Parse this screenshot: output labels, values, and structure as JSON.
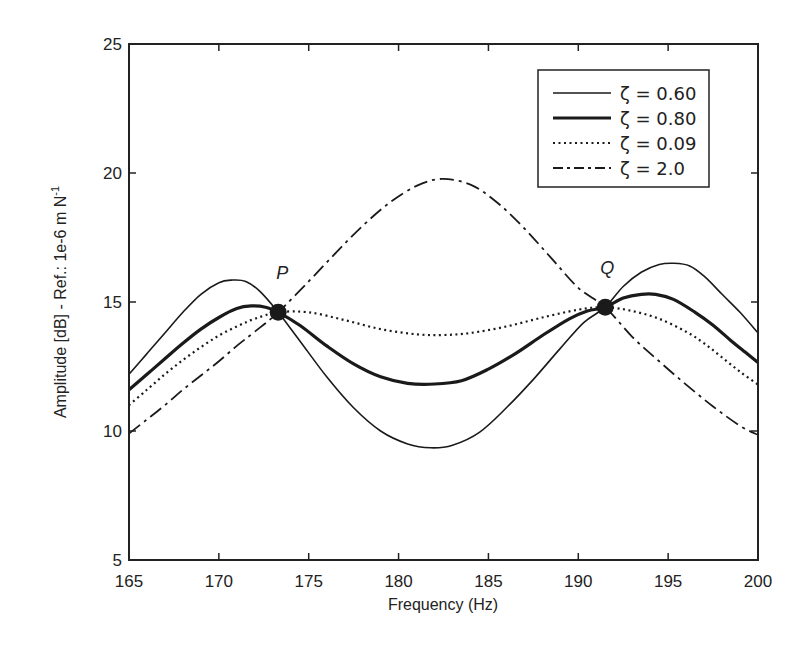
{
  "chart_data": {
    "type": "line",
    "title": "",
    "xlabel": "Frequency (Hz)",
    "ylabel": "Amplitude [dB] - Ref.: 1e-6 m N",
    "ylabel_superscript": "-1",
    "xlim": [
      165,
      200
    ],
    "ylim": [
      5,
      25
    ],
    "xticks": [
      165,
      170,
      175,
      180,
      185,
      190,
      195,
      200
    ],
    "yticks": [
      5,
      10,
      15,
      20,
      25
    ],
    "grid": false,
    "legend_position": "upper right",
    "series": [
      {
        "name": "ζ = 0.60",
        "style": "solid-thin",
        "x": [
          165,
          166,
          167,
          168,
          169,
          170,
          170.7,
          171.5,
          172.3,
          173.3,
          174.5,
          176,
          177.5,
          179,
          180.5,
          181.8,
          183,
          184.5,
          186,
          187.5,
          189,
          190.3,
          191.5,
          192.5,
          193.5,
          194.5,
          195.3,
          196.2,
          197,
          198,
          199,
          200
        ],
        "y": [
          12.2,
          13.0,
          13.8,
          14.6,
          15.3,
          15.75,
          15.85,
          15.8,
          15.4,
          14.6,
          13.5,
          12.1,
          10.9,
          10.0,
          9.5,
          9.35,
          9.45,
          9.95,
          10.9,
          12.0,
          13.2,
          14.2,
          14.8,
          15.6,
          16.15,
          16.45,
          16.5,
          16.4,
          16.0,
          15.3,
          14.6,
          13.8
        ]
      },
      {
        "name": "ζ = 0.80",
        "style": "solid-thick",
        "x": [
          165,
          166,
          167,
          168,
          169,
          170,
          171,
          171.8,
          172.6,
          173.3,
          174.5,
          176,
          177.5,
          179,
          180.5,
          182,
          183.5,
          185,
          186.5,
          188,
          189.5,
          190.5,
          191.5,
          192.5,
          193.5,
          194.3,
          195.3,
          196.5,
          197.5,
          198.5,
          199.3,
          200
        ],
        "y": [
          11.6,
          12.2,
          12.8,
          13.4,
          13.95,
          14.4,
          14.75,
          14.85,
          14.8,
          14.6,
          14.1,
          13.3,
          12.6,
          12.1,
          11.85,
          11.82,
          11.95,
          12.4,
          13.0,
          13.7,
          14.35,
          14.65,
          14.8,
          15.15,
          15.3,
          15.3,
          15.1,
          14.6,
          14.1,
          13.5,
          13.05,
          12.65
        ]
      },
      {
        "name": "ζ = 0.09",
        "style": "dotted",
        "x": [
          165,
          166,
          167,
          168,
          169,
          170,
          171,
          172,
          173.3,
          175,
          177,
          179,
          181,
          182.5,
          184,
          186,
          188,
          190,
          191.5,
          193,
          194.5,
          196,
          197,
          198,
          199,
          200
        ],
        "y": [
          11.0,
          11.6,
          12.2,
          12.75,
          13.25,
          13.7,
          14.05,
          14.35,
          14.6,
          14.6,
          14.3,
          13.95,
          13.75,
          13.72,
          13.8,
          14.05,
          14.4,
          14.7,
          14.8,
          14.65,
          14.35,
          13.85,
          13.4,
          12.85,
          12.3,
          11.8
        ]
      },
      {
        "name": "ζ = 2.0",
        "style": "dash-dot",
        "x": [
          165,
          166,
          167,
          168,
          169,
          170,
          171,
          172,
          173.3,
          175,
          176.5,
          178,
          179.5,
          181,
          182.4,
          184,
          185.5,
          187,
          188.5,
          190,
          191.5,
          193,
          194.5,
          196,
          197.5,
          199,
          200
        ],
        "y": [
          9.9,
          10.45,
          11.0,
          11.6,
          12.15,
          12.7,
          13.3,
          13.85,
          14.6,
          15.8,
          16.9,
          17.95,
          18.85,
          19.5,
          19.77,
          19.55,
          18.85,
          17.85,
          16.7,
          15.55,
          14.8,
          13.65,
          12.7,
          11.8,
          10.95,
          10.2,
          9.85
        ]
      }
    ],
    "annotations": [
      {
        "label": "P",
        "x": 173.3,
        "y": 14.6,
        "marker": "filled-circle"
      },
      {
        "label": "Q",
        "x": 191.5,
        "y": 14.8,
        "marker": "filled-circle"
      }
    ]
  },
  "colors": {
    "line": "#1a1a1a",
    "axis": "#222222",
    "background": "#ffffff"
  }
}
